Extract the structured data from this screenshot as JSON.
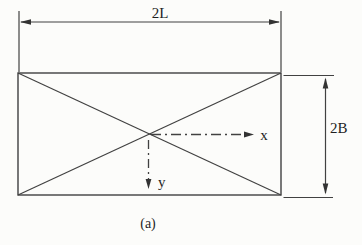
{
  "figure": {
    "caption": "(a)",
    "dimensions": {
      "width_label": "2L",
      "height_label": "2B"
    },
    "axes": {
      "x_label": "x",
      "y_label": "y"
    },
    "colors": {
      "ink": "#414141",
      "paper": "#fcfcfa"
    }
  }
}
